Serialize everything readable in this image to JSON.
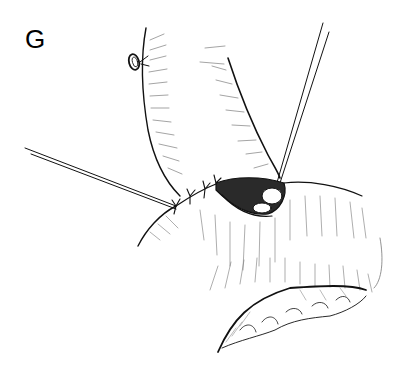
{
  "figure": {
    "label": "G",
    "background": "#ffffff",
    "ink_color": "#111111",
    "hatch_color": "#555555",
    "elements": [
      "figure-label",
      "bowel-segment-upper",
      "suture-ring",
      "anastomosis-opening",
      "suture-knots",
      "stay-suture-left",
      "stay-suture-right",
      "bowel-segment-lower",
      "mesentery"
    ]
  }
}
